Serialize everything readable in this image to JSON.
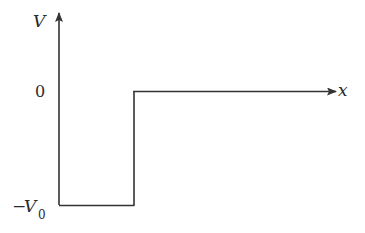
{
  "diagram": {
    "axes": {
      "y_label": "V",
      "x_label": "x"
    },
    "ticks": {
      "zero": "0",
      "neg_v0_sign": "−",
      "neg_v0_var": "V",
      "neg_v0_sub": "0"
    },
    "colors": {
      "line": "#333333",
      "text": "#2a2a2a",
      "background": "#ffffff"
    },
    "potential": {
      "description": "V = -V0 for 0 < x < a; V = 0 for x > a",
      "segments": [
        {
          "from": "y-axis",
          "level": "-V0"
        },
        {
          "step_at": "a",
          "to_level": "0"
        },
        {
          "continues": "to +x",
          "level": "0"
        }
      ]
    }
  }
}
